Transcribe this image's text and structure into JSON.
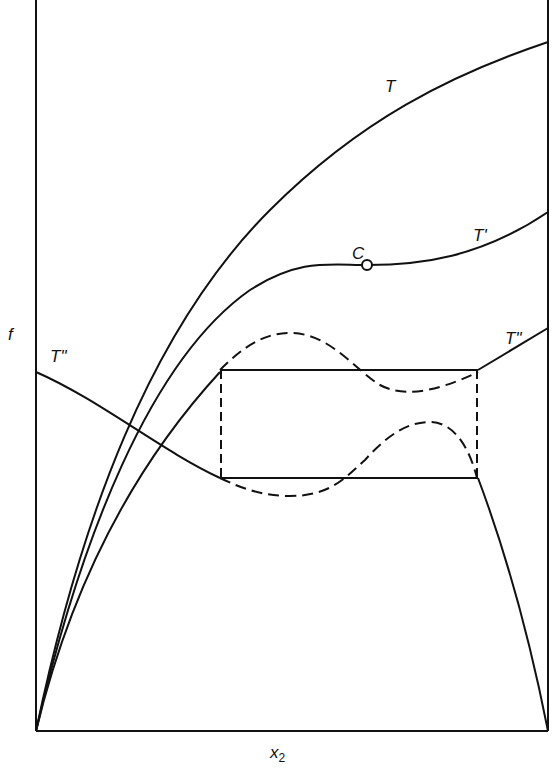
{
  "diagram": {
    "axes": {
      "y_label": "f",
      "x_label": "x",
      "x_label_subscript": "2"
    },
    "curves": [
      {
        "id": "T",
        "label": "T",
        "style": "solid"
      },
      {
        "id": "T_prime",
        "label": "T'",
        "style": "solid"
      },
      {
        "id": "T_double_prime_left",
        "label": "T\"",
        "style": "solid"
      },
      {
        "id": "T_double_prime_right",
        "label": "T\"",
        "style": "solid"
      }
    ],
    "points": [
      {
        "id": "critical_point",
        "label": "C",
        "marker": "open-circle"
      }
    ],
    "construction": {
      "rectangle": "common tangent box (solid horizontals, dashed verticals)",
      "dashed_curves": 2
    },
    "colors": {
      "ink": "#111111",
      "background": "#ffffff"
    }
  }
}
